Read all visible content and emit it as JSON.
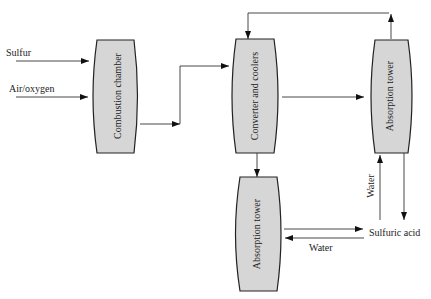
{
  "diagram": {
    "type": "process flow diagram",
    "units": {
      "combustion_chamber": {
        "label": "Combustion chamber"
      },
      "converter": {
        "label": "Converter and coolers"
      },
      "absorption_tower_right": {
        "label": "Absorption tower"
      },
      "absorption_tower_bottom": {
        "label": "Absorption tower"
      }
    },
    "streams": {
      "sulfur": "Sulfur",
      "air_oxygen": "Air/oxygen",
      "water_right": "Water",
      "sulfuric_acid": "Sulfuric acid",
      "water_bottom": "Water"
    },
    "colors": {
      "vessel_fill": "#d6d6d6",
      "stroke": "#222222",
      "background": "#ffffff"
    }
  }
}
